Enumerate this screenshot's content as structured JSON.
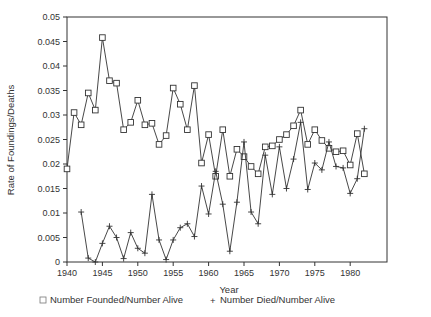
{
  "chart_data": {
    "type": "line",
    "title": "",
    "xlabel": "Year",
    "ylabel": "Rate of Foundings/Deaths",
    "xlim": [
      1940,
      1985
    ],
    "ylim": [
      0,
      0.05
    ],
    "x_ticks": [
      "1940",
      "1945",
      "1950",
      "1955",
      "1960",
      "1965",
      "1970",
      "1975",
      "1980"
    ],
    "y_ticks": [
      "0",
      "0.005",
      "0.01",
      "0.015",
      "0.02",
      "0.025",
      "0.03",
      "0.035",
      "0.04",
      "0.045",
      "0.05"
    ],
    "grid": false,
    "legend_position": "bottom",
    "series": [
      {
        "name": "Number Founded/Number Alive",
        "marker": "square",
        "x": [
          1940,
          1941,
          1942,
          1943,
          1944,
          1945,
          1946,
          1947,
          1948,
          1949,
          1950,
          1951,
          1952,
          1953,
          1954,
          1955,
          1956,
          1957,
          1958,
          1959,
          1960,
          1961,
          1962,
          1963,
          1964,
          1965,
          1966,
          1967,
          1968,
          1969,
          1970,
          1971,
          1972,
          1973,
          1974,
          1975,
          1976,
          1977,
          1978,
          1979,
          1980,
          1981,
          1982
        ],
        "values": [
          0.019,
          0.0305,
          0.028,
          0.0345,
          0.031,
          0.0458,
          0.037,
          0.0365,
          0.027,
          0.0285,
          0.033,
          0.028,
          0.0283,
          0.024,
          0.0258,
          0.0355,
          0.0322,
          0.027,
          0.036,
          0.0202,
          0.026,
          0.0175,
          0.027,
          0.0175,
          0.023,
          0.0215,
          0.0195,
          0.018,
          0.0235,
          0.0237,
          0.025,
          0.026,
          0.0278,
          0.031,
          0.024,
          0.027,
          0.0248,
          0.0232,
          0.0225,
          0.0227,
          0.0198,
          0.0262,
          0.018
        ]
      },
      {
        "name": "Number Died/Number Alive",
        "marker": "plus",
        "x": [
          1942,
          1943,
          1944,
          1945,
          1946,
          1947,
          1948,
          1949,
          1950,
          1951,
          1952,
          1953,
          1954,
          1955,
          1956,
          1957,
          1958,
          1959,
          1960,
          1961,
          1962,
          1963,
          1964,
          1965,
          1966,
          1967,
          1968,
          1969,
          1970,
          1971,
          1972,
          1973,
          1974,
          1975,
          1976,
          1977,
          1978,
          1979,
          1980,
          1981,
          1982
        ],
        "values": [
          0.0102,
          0.0008,
          0.0,
          0.0038,
          0.0073,
          0.005,
          0.0007,
          0.006,
          0.0028,
          0.0018,
          0.0138,
          0.0045,
          0.0005,
          0.0045,
          0.007,
          0.0078,
          0.0052,
          0.0155,
          0.0098,
          0.0185,
          0.0118,
          0.0022,
          0.0122,
          0.0245,
          0.0102,
          0.0078,
          0.0218,
          0.0138,
          0.0235,
          0.015,
          0.021,
          0.0285,
          0.0148,
          0.0202,
          0.0188,
          0.0245,
          0.0195,
          0.0192,
          0.014,
          0.017,
          0.0272
        ]
      }
    ]
  },
  "legend": {
    "item1_symbol": "□",
    "item1_label": "Number Founded/Number Alive",
    "item2_symbol": "+",
    "item2_label": "Number Died/Number Alive"
  },
  "axes": {
    "xlabel": "Year",
    "ylabel": "Rate of Foundings/Deaths"
  },
  "colors": {
    "line": "#333333",
    "background": "#ffffff"
  }
}
